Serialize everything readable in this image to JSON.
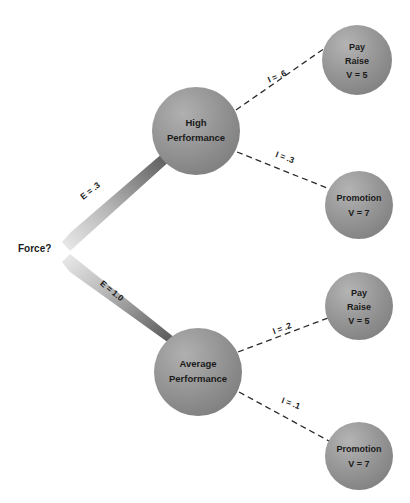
{
  "diagram": {
    "type": "node-link-tree",
    "background_color": "#ffffff",
    "node_fill_color": "#8c8c8c",
    "node_text_color": "#1a1a1a",
    "arrow_gradient": {
      "start": "#e4e4e4",
      "end": "#3a3a3a"
    },
    "dashed_edge_color": "#2b2b2b",
    "source": {
      "id": "force",
      "label": "Force?",
      "x": 18,
      "y": 249
    },
    "performance_nodes": [
      {
        "id": "high-performance",
        "line1": "High",
        "line2": "Performance",
        "cx": 196,
        "cy": 131,
        "r": 44
      },
      {
        "id": "average-performance",
        "line1": "Average",
        "line2": "Performance",
        "cx": 198,
        "cy": 372,
        "r": 44
      }
    ],
    "outcome_nodes": [
      {
        "id": "pay-raise-high",
        "line1": "Pay",
        "line2": "Raise",
        "line3": "V = 5",
        "cx": 357,
        "cy": 60,
        "r": 35
      },
      {
        "id": "promotion-high",
        "line1": "Promotion",
        "line2": "V = 7",
        "cx": 359,
        "cy": 205,
        "r": 34
      },
      {
        "id": "pay-raise-average",
        "line1": "Pay",
        "line2": "Raise",
        "line3": "V = 5",
        "cx": 359,
        "cy": 306,
        "r": 34
      },
      {
        "id": "promotion-average",
        "line1": "Promotion",
        "line2": "V = 7",
        "cx": 359,
        "cy": 456,
        "r": 34
      }
    ],
    "expectancy_arrows": [
      {
        "id": "expectancy-high",
        "label": "E = .3",
        "from": "force",
        "to": "high-performance",
        "label_x": 92,
        "label_y": 193,
        "label_rotation": -39
      },
      {
        "id": "expectancy-average",
        "label": "E = 1.0",
        "from": "force",
        "to": "average-performance",
        "label_x": 110,
        "label_y": 293,
        "label_rotation": 39
      }
    ],
    "instrumentality_edges": [
      {
        "id": "instrumentality-high-pay-raise",
        "label": "I = .6",
        "from": "high-performance",
        "to": "pay-raise-high",
        "label_x": 278,
        "label_y": 79,
        "label_rotation": -23
      },
      {
        "id": "instrumentality-high-promotion",
        "label": "I = .3",
        "from": "high-performance",
        "to": "promotion-high",
        "label_x": 284,
        "label_y": 160,
        "label_rotation": 20
      },
      {
        "id": "instrumentality-average-pay-raise",
        "label": "I = .2",
        "from": "average-performance",
        "to": "pay-raise-average",
        "label_x": 283,
        "label_y": 331,
        "label_rotation": -20
      },
      {
        "id": "instrumentality-average-promotion",
        "label": "I = .1",
        "from": "average-performance",
        "to": "promotion-average",
        "label_x": 290,
        "label_y": 406,
        "label_rotation": 20
      }
    ]
  }
}
